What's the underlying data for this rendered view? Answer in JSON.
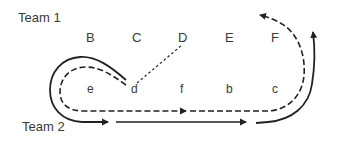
{
  "teams": {
    "team1": "Team 1",
    "team2": "Team 2"
  },
  "positions_upper": [
    "B",
    "C",
    "D",
    "E",
    "F"
  ],
  "positions_lower": [
    "e",
    "d",
    "f",
    "b",
    "c"
  ],
  "paths": {
    "solid_path": "Team 2 running route (solid, arrowed)",
    "dashed_path": "Team route (dashed, arrowed)",
    "dotted_link": "dotted connector d to D"
  },
  "colors": {
    "stroke": "#222222",
    "text": "#3a3a3a",
    "background": "#ffffff"
  }
}
